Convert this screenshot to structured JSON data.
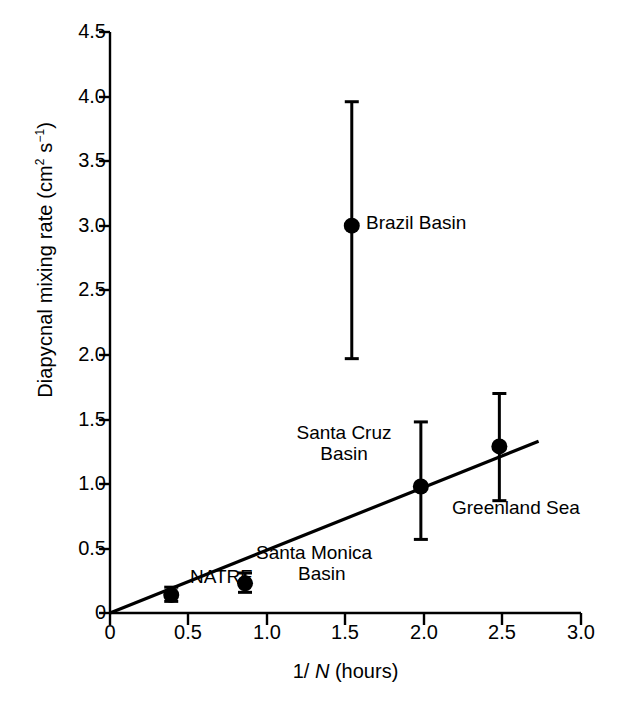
{
  "chart_data": {
    "type": "scatter",
    "title": "",
    "xlabel": "1/ N (hours)",
    "xlabel_parts": {
      "pre": "1/ ",
      "italic": "N",
      "post": " (hours)"
    },
    "ylabel": "Diapycnal mixing rate (cm2 s-1)",
    "ylabel_parts": {
      "pre": "Diapycnal mixing rate (cm",
      "sup1": "2",
      "mid": " s",
      "sup2": "−1",
      "post": ")"
    },
    "xlim": [
      0,
      3.0
    ],
    "ylim": [
      0,
      4.5
    ],
    "xticks": [
      "0",
      "0.5",
      "1.0",
      "1.5",
      "2.0",
      "2.5",
      "3.0"
    ],
    "xtick_values": [
      0,
      0.5,
      1.0,
      1.5,
      2.0,
      2.5,
      3.0
    ],
    "yticks": [
      "0",
      "0.5",
      "1.0",
      "1.5",
      "2.0",
      "2.5",
      "3.0",
      "3.5",
      "4.0",
      "4.5"
    ],
    "ytick_values": [
      0,
      0.5,
      1.0,
      1.5,
      2.0,
      2.5,
      3.0,
      3.5,
      4.0,
      4.5
    ],
    "grid": false,
    "legend": "none",
    "marker": "filled-circle",
    "error_bars": "vertical",
    "points": [
      {
        "name": "NATRE",
        "x": 0.39,
        "y": 0.14,
        "ylow": 0.09,
        "yhigh": 0.2,
        "label": "NATRE",
        "label_pos": "right"
      },
      {
        "name": "Santa Monica Basin",
        "x": 0.86,
        "y": 0.23,
        "ylow": 0.16,
        "yhigh": 0.31,
        "label": "Santa Monica\nBasin",
        "label_line1": "Santa Monica",
        "label_line2": "Basin",
        "label_pos": "right"
      },
      {
        "name": "Brazil Basin",
        "x": 1.54,
        "y": 3.0,
        "ylow": 1.97,
        "yhigh": 3.96,
        "label": "Brazil Basin",
        "label_pos": "right"
      },
      {
        "name": "Santa Cruz Basin",
        "x": 1.98,
        "y": 0.98,
        "ylow": 0.57,
        "yhigh": 1.48,
        "label": "Santa Cruz\nBasin",
        "label_line1": "Santa Cruz",
        "label_line2": "Basin",
        "label_pos": "left"
      },
      {
        "name": "Greenland Sea",
        "x": 2.48,
        "y": 1.29,
        "ylow": 0.87,
        "yhigh": 1.7,
        "label": "Greenland Sea",
        "label_pos": "below-right"
      }
    ],
    "trend_line": {
      "type": "linear-fit",
      "x0": 0.0,
      "y0": 0.0,
      "x1": 2.73,
      "y1": 1.33,
      "slope": 0.487,
      "intercept": 0.0
    },
    "colors": {
      "axis": "#000000",
      "marker": "#000000",
      "errorbar": "#000000",
      "trend": "#000000",
      "background": "#ffffff",
      "text": "#000000"
    }
  }
}
